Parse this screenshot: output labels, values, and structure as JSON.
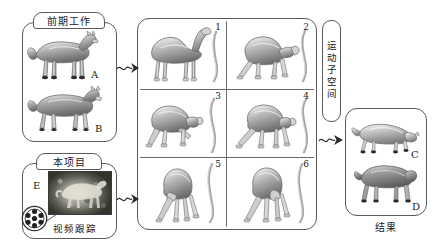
{
  "figure": {
    "kind": "pipeline-diagram",
    "ink_color": "#5a5a5a",
    "text_color": "#1a1a1a"
  },
  "previous_work": {
    "tab_label": "前期工作",
    "models": [
      {
        "letter": "A",
        "animal": "wolf-standing"
      },
      {
        "letter": "B",
        "animal": "wolf-walking"
      }
    ]
  },
  "this_project": {
    "tab_label": "本项目",
    "frame_letter": "E",
    "tracking_label": "视频跟踪",
    "icon": "film-reel-icon"
  },
  "motion_subspace": {
    "label": "运动子空间",
    "cells": [
      {
        "num": "1",
        "pose": "camel-stand-side"
      },
      {
        "num": "2",
        "pose": "camel-lower-head"
      },
      {
        "num": "3",
        "pose": "camel-crouch-left"
      },
      {
        "num": "4",
        "pose": "camel-crouch-wide"
      },
      {
        "num": "5",
        "pose": "camel-kneel-front"
      },
      {
        "num": "6",
        "pose": "camel-kneel-turn"
      }
    ]
  },
  "results": {
    "caption": "结果",
    "models": [
      {
        "letter": "C",
        "animal": "wolf-lowered"
      },
      {
        "letter": "D",
        "animal": "dog-standing"
      }
    ]
  },
  "arrows": [
    {
      "name": "arrow-prev-to-grid",
      "from": "previous_work",
      "to": "motion_subspace"
    },
    {
      "name": "arrow-project-to-grid",
      "from": "this_project",
      "to": "motion_subspace"
    },
    {
      "name": "arrow-grid-to-results",
      "from": "motion_subspace",
      "to": "results"
    }
  ]
}
